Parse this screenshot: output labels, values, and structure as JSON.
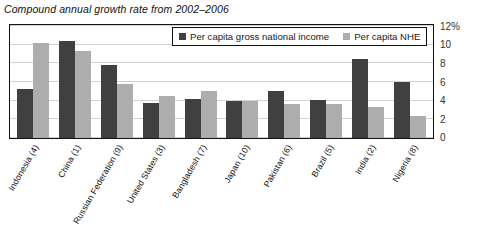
{
  "chart_data": {
    "type": "bar",
    "title": "Compound annual growth rate from 2002–2006",
    "xlabel": "",
    "ylabel": "",
    "ylim": [
      0,
      12
    ],
    "ytick_values": [
      12,
      10,
      8,
      6,
      4,
      2,
      0
    ],
    "ytick_labels": [
      "12%",
      "10",
      "8",
      "6",
      "4",
      "2",
      "0"
    ],
    "grid": true,
    "legend_position": "top-center-inside",
    "categories": [
      "Indonesia (4)",
      "China (1)",
      "Russian Federation (9)",
      "United States (3)",
      "Bangladesh (7)",
      "Japan (10)",
      "Pakistan (6)",
      "Brazil (5)",
      "India (2)",
      "Nigeria (8)"
    ],
    "series": [
      {
        "name": "Per capita gross national income",
        "color": "#404040",
        "values": [
          5.3,
          10.4,
          7.8,
          3.8,
          4.2,
          4.0,
          5.0,
          4.1,
          8.5,
          6.0
        ]
      },
      {
        "name": "Per capita NHE",
        "color": "#adadad",
        "values": [
          10.2,
          9.3,
          5.8,
          4.5,
          5.0,
          4.0,
          3.7,
          3.6,
          3.3,
          2.4
        ]
      }
    ]
  }
}
